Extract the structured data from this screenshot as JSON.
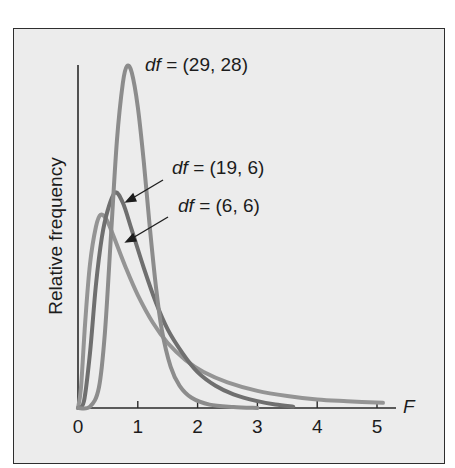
{
  "chart_data": {
    "type": "line",
    "title": "",
    "xlabel": "F",
    "ylabel": "Relative frequency",
    "xlim": [
      0,
      5.3
    ],
    "x_ticks": [
      "0",
      "1",
      "2",
      "3",
      "4",
      "5"
    ],
    "y_ticks": [],
    "grid": false,
    "legend": "inline annotations",
    "series": [
      {
        "name": "df = (29, 28)",
        "label_prefix": "df",
        "label_rest": " = (29, 28)",
        "color": "#8c8c8c",
        "points": [
          [
            0,
            0
          ],
          [
            0.2,
            0.004
          ],
          [
            0.35,
            0.06
          ],
          [
            0.45,
            0.22
          ],
          [
            0.55,
            0.5
          ],
          [
            0.65,
            0.78
          ],
          [
            0.75,
            0.95
          ],
          [
            0.82,
            1.0
          ],
          [
            0.9,
            0.98
          ],
          [
            1.0,
            0.88
          ],
          [
            1.1,
            0.72
          ],
          [
            1.2,
            0.53
          ],
          [
            1.3,
            0.36
          ],
          [
            1.4,
            0.23
          ],
          [
            1.55,
            0.12
          ],
          [
            1.7,
            0.065
          ],
          [
            1.9,
            0.03
          ],
          [
            2.2,
            0.01
          ],
          [
            2.6,
            0.003
          ],
          [
            3.0,
            0.0
          ]
        ]
      },
      {
        "name": "df = (19, 6)",
        "label_prefix": "df",
        "label_rest": " = (19, 6)",
        "color": "#6f6f6f",
        "points": [
          [
            0,
            0
          ],
          [
            0.1,
            0.02
          ],
          [
            0.2,
            0.16
          ],
          [
            0.3,
            0.36
          ],
          [
            0.4,
            0.5
          ],
          [
            0.5,
            0.58
          ],
          [
            0.62,
            0.63
          ],
          [
            0.75,
            0.6
          ],
          [
            0.9,
            0.52
          ],
          [
            1.1,
            0.41
          ],
          [
            1.3,
            0.31
          ],
          [
            1.5,
            0.23
          ],
          [
            1.75,
            0.16
          ],
          [
            2.0,
            0.105
          ],
          [
            2.3,
            0.065
          ],
          [
            2.6,
            0.04
          ],
          [
            3.0,
            0.02
          ],
          [
            3.3,
            0.01
          ],
          [
            3.6,
            0.004
          ]
        ]
      },
      {
        "name": "df = (6, 6)",
        "label_prefix": "df",
        "label_rest": " = (6, 6)",
        "color": "#949494",
        "points": [
          [
            0,
            0
          ],
          [
            0.05,
            0.06
          ],
          [
            0.12,
            0.25
          ],
          [
            0.2,
            0.42
          ],
          [
            0.3,
            0.53
          ],
          [
            0.38,
            0.565
          ],
          [
            0.48,
            0.55
          ],
          [
            0.6,
            0.5
          ],
          [
            0.8,
            0.41
          ],
          [
            1.0,
            0.33
          ],
          [
            1.25,
            0.25
          ],
          [
            1.5,
            0.19
          ],
          [
            1.8,
            0.14
          ],
          [
            2.1,
            0.105
          ],
          [
            2.5,
            0.075
          ],
          [
            3.0,
            0.05
          ],
          [
            3.5,
            0.035
          ],
          [
            4.0,
            0.025
          ],
          [
            4.5,
            0.02
          ],
          [
            5.1,
            0.015
          ]
        ]
      }
    ]
  },
  "labels": {
    "s1_prefix": "df",
    "s1_rest": " = (29, 28)",
    "s2_prefix": "df",
    "s2_rest": " = (19, 6)",
    "s3_prefix": "df",
    "s3_rest": " = (6, 6)",
    "ylabel": "Relative frequency",
    "xlabel": "F",
    "ticks": [
      "0",
      "1",
      "2",
      "3",
      "4",
      "5"
    ]
  }
}
